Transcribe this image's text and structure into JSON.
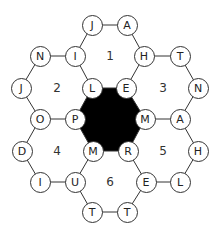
{
  "puzzle": {
    "type": "hexagon word puzzle",
    "colors": {
      "line": "#333333",
      "center_fill": "#000000",
      "node_fill": "#ffffff"
    },
    "nodes": [
      {
        "id": "n0",
        "letter": "J",
        "x": 92,
        "y": 25
      },
      {
        "id": "n1",
        "letter": "A",
        "x": 127,
        "y": 25
      },
      {
        "id": "n2",
        "letter": "N",
        "x": 40,
        "y": 56
      },
      {
        "id": "n3",
        "letter": "I",
        "x": 75,
        "y": 56
      },
      {
        "id": "n4",
        "letter": "H",
        "x": 144,
        "y": 56
      },
      {
        "id": "n5",
        "letter": "T",
        "x": 180,
        "y": 56
      },
      {
        "id": "n6",
        "letter": "J",
        "x": 21,
        "y": 88
      },
      {
        "id": "n7",
        "letter": "L",
        "x": 92,
        "y": 88
      },
      {
        "id": "n8",
        "letter": "E",
        "x": 126,
        "y": 88
      },
      {
        "id": "n9",
        "letter": "N",
        "x": 198,
        "y": 88
      },
      {
        "id": "n10",
        "letter": "O",
        "x": 40,
        "y": 119
      },
      {
        "id": "n11",
        "letter": "P",
        "x": 75,
        "y": 119
      },
      {
        "id": "n12",
        "letter": "M",
        "x": 145,
        "y": 119
      },
      {
        "id": "n13",
        "letter": "A",
        "x": 180,
        "y": 119
      },
      {
        "id": "n14",
        "letter": "D",
        "x": 22,
        "y": 151
      },
      {
        "id": "n15",
        "letter": "M",
        "x": 93,
        "y": 151
      },
      {
        "id": "n16",
        "letter": "R",
        "x": 128,
        "y": 151
      },
      {
        "id": "n17",
        "letter": "H",
        "x": 198,
        "y": 151
      },
      {
        "id": "n18",
        "letter": "I",
        "x": 40,
        "y": 182
      },
      {
        "id": "n19",
        "letter": "U",
        "x": 75,
        "y": 182
      },
      {
        "id": "n20",
        "letter": "E",
        "x": 146,
        "y": 182
      },
      {
        "id": "n21",
        "letter": "L",
        "x": 180,
        "y": 182
      },
      {
        "id": "n22",
        "letter": "T",
        "x": 92,
        "y": 212
      },
      {
        "id": "n23",
        "letter": "T",
        "x": 127,
        "y": 212
      }
    ],
    "cells": [
      {
        "label": "1",
        "x": 110,
        "y": 56
      },
      {
        "label": "2",
        "x": 57,
        "y": 88
      },
      {
        "label": "3",
        "x": 163,
        "y": 88
      },
      {
        "label": "4",
        "x": 57,
        "y": 151
      },
      {
        "label": "5",
        "x": 163,
        "y": 151
      },
      {
        "label": "6",
        "x": 110,
        "y": 182
      }
    ],
    "edges": [
      [
        "n0",
        "n1"
      ],
      [
        "n1",
        "n4"
      ],
      [
        "n4",
        "n8"
      ],
      [
        "n8",
        "n7"
      ],
      [
        "n7",
        "n3"
      ],
      [
        "n3",
        "n0"
      ],
      [
        "n2",
        "n3"
      ],
      [
        "n2",
        "n6"
      ],
      [
        "n6",
        "n10"
      ],
      [
        "n10",
        "n11"
      ],
      [
        "n11",
        "n7"
      ],
      [
        "n4",
        "n5"
      ],
      [
        "n5",
        "n9"
      ],
      [
        "n9",
        "n13"
      ],
      [
        "n13",
        "n12"
      ],
      [
        "n12",
        "n8"
      ],
      [
        "n10",
        "n14"
      ],
      [
        "n14",
        "n18"
      ],
      [
        "n18",
        "n19"
      ],
      [
        "n19",
        "n15"
      ],
      [
        "n15",
        "n11"
      ],
      [
        "n12",
        "n16"
      ],
      [
        "n16",
        "n15"
      ],
      [
        "n13",
        "n17"
      ],
      [
        "n17",
        "n21"
      ],
      [
        "n21",
        "n20"
      ],
      [
        "n20",
        "n16"
      ],
      [
        "n19",
        "n22"
      ],
      [
        "n22",
        "n23"
      ],
      [
        "n23",
        "n20"
      ]
    ],
    "center_hexagon": [
      "n7",
      "n8",
      "n12",
      "n16",
      "n15",
      "n11"
    ]
  }
}
